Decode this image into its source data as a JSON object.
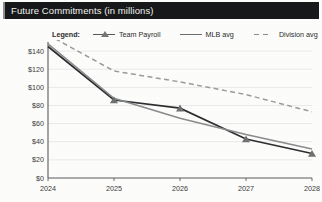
{
  "header": {
    "title": "Future Commitments (in millions)",
    "bar_color": "#17181a",
    "text_color": "#f2f2f0"
  },
  "legend": {
    "label": "Legend:",
    "entries": [
      {
        "name": "Team Payroll",
        "style": "solid-with-triangle-marker",
        "color": "#2d2e30"
      },
      {
        "name": "MLB avg",
        "style": "solid",
        "color": "#8a8b8d"
      },
      {
        "name": "Division avg",
        "style": "dashed",
        "color": "#9a9b9d"
      }
    ]
  },
  "chart_data": {
    "type": "line",
    "title": "Future Commitments (in millions)",
    "xlabel": "",
    "ylabel": "",
    "x": [
      2024,
      2025,
      2026,
      2027,
      2028
    ],
    "categories": [
      "2024",
      "2025",
      "2026",
      "2027",
      "2028"
    ],
    "ylim": [
      0,
      150
    ],
    "yticks": [
      0,
      20,
      40,
      60,
      80,
      100,
      120,
      140
    ],
    "ytick_labels": [
      "$0",
      "$20",
      "$40",
      "$60",
      "$80",
      "$100",
      "$120",
      "$140"
    ],
    "grid": true,
    "legend_position": "top",
    "series": [
      {
        "name": "Team Payroll",
        "values": [
          145,
          86,
          77,
          43,
          27
        ],
        "color": "#2d2e30",
        "dash": false,
        "markers": true
      },
      {
        "name": "MLB avg",
        "values": [
          148,
          88,
          66,
          48,
          32
        ],
        "color": "#8a8b8d",
        "dash": false,
        "markers": false
      },
      {
        "name": "Division avg",
        "values": [
          158,
          118,
          106,
          92,
          73
        ],
        "color": "#9a9b9d",
        "dash": true,
        "markers": false
      }
    ]
  }
}
